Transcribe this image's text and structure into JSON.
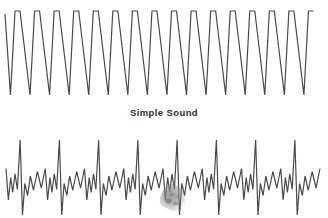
{
  "figure": {
    "width": 328,
    "height": 218,
    "background_color": "#ffffff",
    "stroke_color": "#4a4a4a",
    "label_color": "#2d2d2d"
  },
  "caption": {
    "simple_sound_label": "Simple Sound"
  },
  "artifacts": {
    "smudge": {
      "name": "grey-smudge-blob",
      "color": "#8a8a8a",
      "x": 158,
      "y": 183,
      "width": 30,
      "height": 30
    }
  },
  "chart_data": [
    {
      "type": "line",
      "name": "simple-sound-waveform",
      "title": "Simple Sound",
      "description": "Pure periodic triangular sound wave, constant amplitude and frequency",
      "xlabel": "",
      "ylabel": "",
      "grid": false,
      "legend": null,
      "cycles": 16,
      "x_start": 5,
      "x_end": 318,
      "y_top": 11,
      "y_bottom": 95,
      "peak_flat_width": 5,
      "stroke_width": 1.2,
      "xlim": [
        0,
        328
      ],
      "ylim": [
        11,
        95
      ]
    },
    {
      "type": "line",
      "name": "complex-sound-waveform",
      "title": "",
      "description": "Complex composite sound wave: one tall narrow spike per period plus smaller secondary ripples",
      "xlabel": "",
      "ylabel": "",
      "grid": false,
      "legend": null,
      "cycles": 8,
      "x_start": 6,
      "x_end": 320,
      "y_top": 140,
      "y_bottom": 215,
      "period_width": 39,
      "stroke_width": 1.2,
      "xlim": [
        0,
        328
      ],
      "ylim": [
        140,
        215
      ],
      "period_profile": [
        {
          "t": 0.0,
          "v": 0.62
        },
        {
          "t": 0.06,
          "v": 0.2
        },
        {
          "t": 0.12,
          "v": 0.5
        },
        {
          "t": 0.17,
          "v": 0.3
        },
        {
          "t": 0.23,
          "v": 0.55
        },
        {
          "t": 0.29,
          "v": 0.34
        },
        {
          "t": 0.36,
          "v": 1.0
        },
        {
          "t": 0.42,
          "v": 0.0
        },
        {
          "t": 0.48,
          "v": 0.42
        },
        {
          "t": 0.55,
          "v": 0.26
        },
        {
          "t": 0.62,
          "v": 0.52
        },
        {
          "t": 0.7,
          "v": 0.33
        },
        {
          "t": 0.8,
          "v": 0.58
        },
        {
          "t": 0.9,
          "v": 0.36
        },
        {
          "t": 1.0,
          "v": 0.62
        }
      ]
    }
  ]
}
